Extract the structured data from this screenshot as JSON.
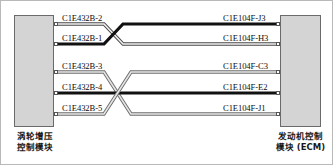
{
  "diagram": {
    "left_module": {
      "caption_line1": "涡轮增压",
      "caption_line2": "控制模块",
      "name": "turbocharger-control-module"
    },
    "right_module": {
      "caption_line1": "发动机控制",
      "caption_line2": "模块 (ECM)",
      "name": "engine-control-module"
    },
    "left_pins": [
      {
        "label": "C1E432B-2",
        "y": 23
      },
      {
        "label": "C1E432B-1",
        "y": 43
      },
      {
        "label": "C1E432B-3",
        "y": 71
      },
      {
        "label": "C1E432B-4",
        "y": 92
      },
      {
        "label": "C1E432B-5",
        "y": 113
      }
    ],
    "right_pins": [
      {
        "label": "C1E104F-J3",
        "y": 23
      },
      {
        "label": "C1E104F-H3",
        "y": 43
      },
      {
        "label": "C1E104F-C3",
        "y": 71
      },
      {
        "label": "C1E104F-E2",
        "y": 92
      },
      {
        "label": "C1E104F-J1",
        "y": 113
      }
    ],
    "wires": [
      {
        "name": "wire-c1e432b-2-to-c1e104f-h3",
        "from": "C1E432B-2",
        "to": "C1E104F-H3",
        "style": "outline-light",
        "color": "#f2f2f2",
        "stroke": "#4a4a4a"
      },
      {
        "name": "wire-c1e432b-1-to-c1e104f-j3",
        "from": "C1E432B-1",
        "to": "C1E104F-J3",
        "style": "solid-black",
        "color": "#111111",
        "stroke": "#111111"
      },
      {
        "name": "wire-c1e432b-3-to-c1e104f-j1",
        "from": "C1E432B-3",
        "to": "C1E104F-J1",
        "style": "outline-gray",
        "color": "#e6e6e6",
        "stroke": "#6d6d6d"
      },
      {
        "name": "wire-c1e432b-4-to-c1e104f-e2",
        "from": "C1E432B-4",
        "to": "C1E104F-E2",
        "style": "solid-black",
        "color": "#111111",
        "stroke": "#111111"
      },
      {
        "name": "wire-c1e432b-5-to-c1e104f-c3",
        "from": "C1E432B-5",
        "to": "C1E104F-C3",
        "style": "outline-gray",
        "color": "#e6e6e6",
        "stroke": "#6d6d6d"
      }
    ],
    "colors": {
      "module_fill": "#d4d4d4",
      "module_border": "#6a6a6a",
      "frame_border": "#b9b9b9",
      "wire_black": "#111111",
      "wire_gray": "#6d6d6d",
      "wire_light_fill": "#f2f2f2"
    }
  }
}
